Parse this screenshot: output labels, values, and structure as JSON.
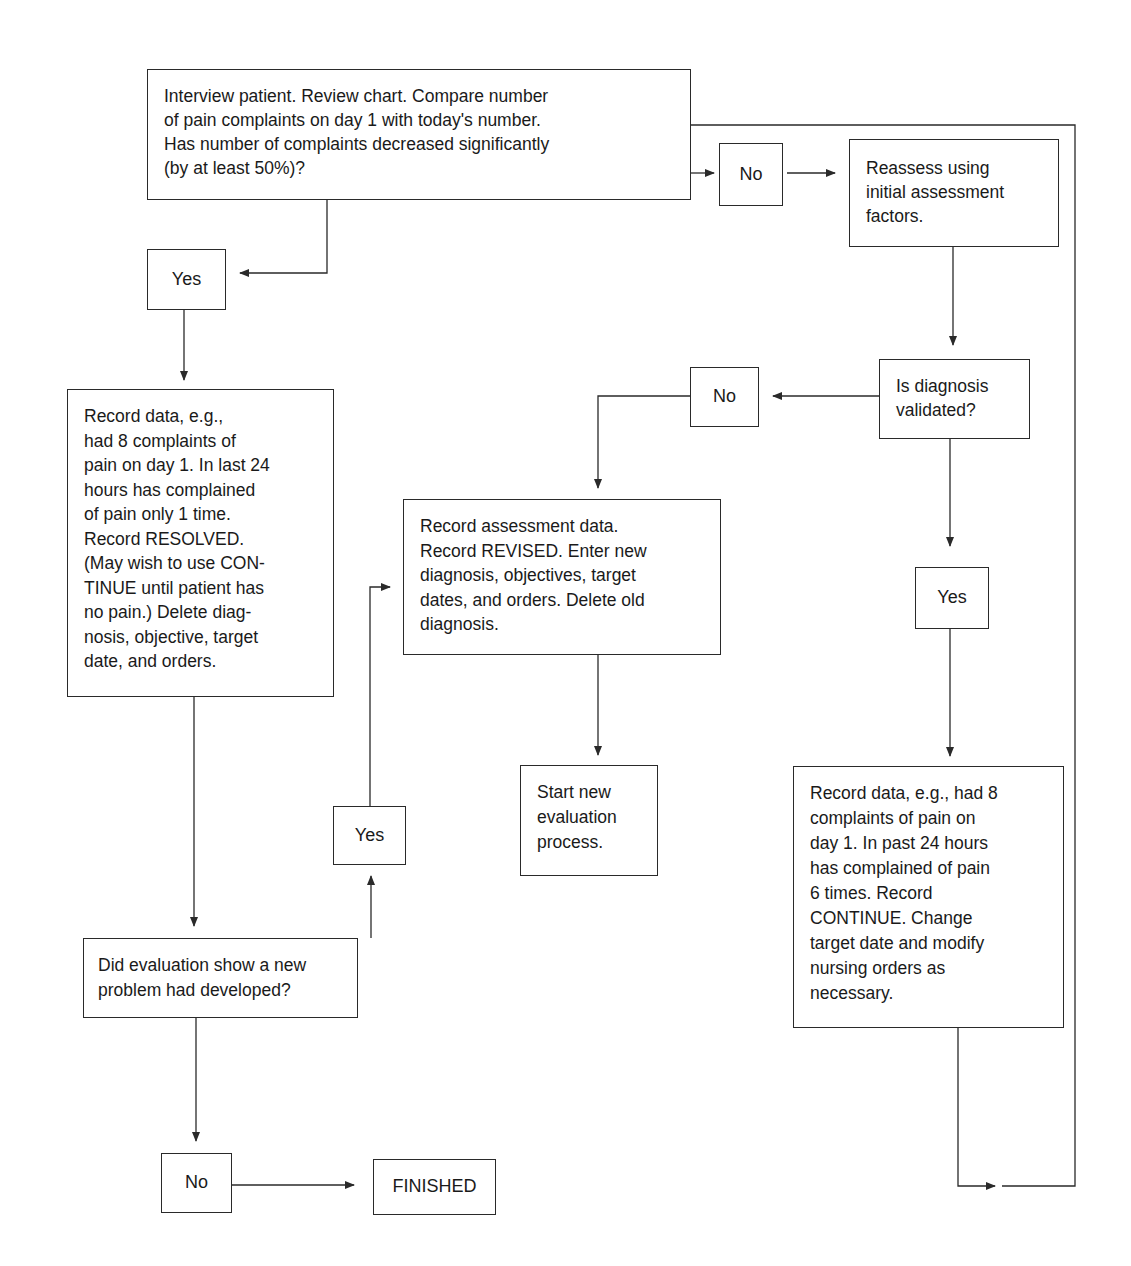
{
  "diagram": {
    "type": "flowchart",
    "nodes": {
      "start": {
        "lines": [
          "Interview patient. Review chart. Compare number",
          "of pain complaints on day 1 with today's number.",
          "Has number of complaints decreased significantly",
          "(by at least 50%)?"
        ]
      },
      "no_top": {
        "label": "No"
      },
      "reassess": {
        "lines": [
          "Reassess using",
          "initial assessment",
          "factors."
        ]
      },
      "yes_left": {
        "label": "Yes"
      },
      "record_resolved": {
        "lines": [
          "Record data, e.g.,",
          "had 8 complaints of",
          "pain on day 1. In last 24",
          "hours has complained",
          "of pain only 1 time.",
          "Record RESOLVED.",
          "(May wish to use CON-",
          "TINUE until patient has",
          "no pain.) Delete diag-",
          "nosis, objective, target",
          "date, and orders."
        ]
      },
      "diagnosis_validated": {
        "lines": [
          "Is diagnosis",
          "validated?"
        ]
      },
      "no_mid": {
        "label": "No"
      },
      "record_revised": {
        "lines": [
          "Record assessment data.",
          "Record REVISED. Enter new",
          "diagnosis, objectives, target",
          "dates, and orders. Delete old",
          "diagnosis."
        ]
      },
      "yes_right": {
        "label": "Yes"
      },
      "start_new": {
        "lines": [
          "Start new",
          "evaluation",
          "process."
        ]
      },
      "yes_mid": {
        "label": "Yes"
      },
      "record_continue": {
        "lines": [
          "Record data, e.g., had 8",
          "complaints of pain on",
          "day 1. In past 24 hours",
          "has complained of pain",
          "6 times. Record",
          "CONTINUE. Change",
          "target date and modify",
          "nursing orders as",
          "necessary."
        ]
      },
      "new_problem": {
        "lines": [
          "Did evaluation show a new",
          "problem had developed?"
        ]
      },
      "no_bottom": {
        "label": "No"
      },
      "finished": {
        "label": "FINISHED"
      }
    },
    "edges": [
      {
        "from": "start",
        "to": "no_top"
      },
      {
        "from": "no_top",
        "to": "reassess"
      },
      {
        "from": "start",
        "to": "yes_left"
      },
      {
        "from": "yes_left",
        "to": "record_resolved"
      },
      {
        "from": "reassess",
        "to": "diagnosis_validated"
      },
      {
        "from": "diagnosis_validated",
        "to": "no_mid"
      },
      {
        "from": "no_mid",
        "to": "record_revised"
      },
      {
        "from": "diagnosis_validated",
        "to": "yes_right"
      },
      {
        "from": "yes_right",
        "to": "record_continue"
      },
      {
        "from": "record_revised",
        "to": "start_new"
      },
      {
        "from": "record_resolved",
        "to": "new_problem"
      },
      {
        "from": "new_problem",
        "to": "yes_mid"
      },
      {
        "from": "yes_mid",
        "to": "record_revised"
      },
      {
        "from": "new_problem",
        "to": "no_bottom"
      },
      {
        "from": "no_bottom",
        "to": "finished"
      },
      {
        "from": "record_continue",
        "to": "start"
      }
    ],
    "colors": {
      "line": "#2a2a2a",
      "text": "#1a1a1a",
      "background": "#ffffff"
    }
  }
}
